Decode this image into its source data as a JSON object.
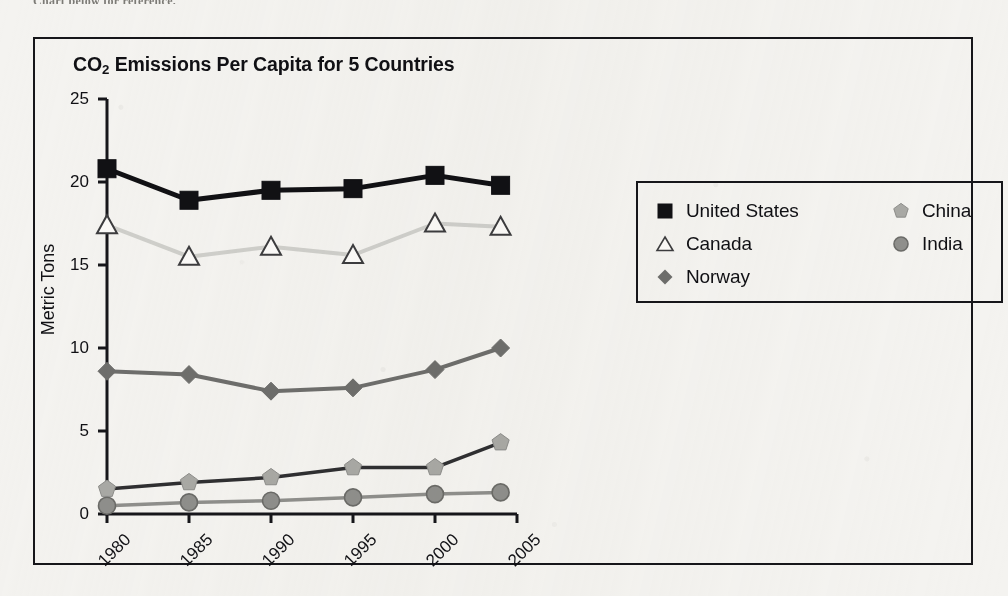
{
  "page": {
    "background_color": "#f4f3f0",
    "cut_text_top": "Chart below for reference."
  },
  "chart_frame": {
    "border_color": "#16161a"
  },
  "legend": {
    "position": "inside-right",
    "columns": [
      {
        "items": [
          {
            "label": "United States",
            "marker": "filled-square-marker",
            "color": "#111114"
          },
          {
            "label": "Canada",
            "marker": "open-triangle-marker",
            "color": "#cfcfcb"
          },
          {
            "label": "Norway",
            "marker": "filled-diamond-marker",
            "color": "#6e6e6c"
          }
        ]
      },
      {
        "items": [
          {
            "label": "China",
            "marker": "filled-pentagon-marker",
            "color": "#a9a9a5"
          },
          {
            "label": "India",
            "marker": "filled-circle-marker",
            "color": "#8f8f8c"
          }
        ]
      }
    ]
  },
  "chart_data": {
    "type": "line",
    "title": "CO2 Emissions Per Capita for 5 Countries",
    "title_html": "CO<sub>2</sub> Emissions Per Capita for 5 Countries",
    "xlabel": "",
    "ylabel": "Metric Tons",
    "x": [
      1980,
      1985,
      1990,
      1995,
      2000,
      2004
    ],
    "categories": [
      "1980",
      "1985",
      "1990",
      "1995",
      "2000",
      "2005"
    ],
    "xtick_labels": [
      "1980",
      "1985",
      "1990",
      "1995",
      "2000",
      "2005"
    ],
    "xtick_rotation": -45,
    "ytick_labels": [
      "0",
      "5",
      "10",
      "15",
      "20",
      "25"
    ],
    "yticks": [
      0,
      5,
      10,
      15,
      20,
      25
    ],
    "ylim": [
      0,
      25
    ],
    "xlim": [
      1978.6,
      2006.2
    ],
    "grid": false,
    "legend_position": "right",
    "series": [
      {
        "name": "United States",
        "values": [
          20.8,
          18.9,
          19.5,
          19.6,
          20.4,
          19.8
        ],
        "color": "#111114",
        "line_width": 5,
        "marker": "square"
      },
      {
        "name": "Canada",
        "values": [
          17.4,
          15.5,
          16.1,
          15.6,
          17.5,
          17.3
        ],
        "color": "#cfcfcb",
        "line_width": 4,
        "marker": "triangle-open"
      },
      {
        "name": "Norway",
        "values": [
          8.6,
          8.4,
          7.4,
          7.6,
          8.7,
          10.0
        ],
        "color": "#6e6e6c",
        "line_width": 4,
        "marker": "diamond"
      },
      {
        "name": "China",
        "values": [
          1.5,
          1.9,
          2.2,
          2.8,
          2.8,
          4.3
        ],
        "color": "#2f2f31",
        "marker_color": "#a9a9a5",
        "line_width": 3.5,
        "marker": "pentagon"
      },
      {
        "name": "India",
        "values": [
          0.5,
          0.7,
          0.8,
          1.0,
          1.2,
          1.3
        ],
        "color": "#8f8f8c",
        "marker_color": "#8f8f8c",
        "line_width": 3.5,
        "marker": "circle"
      }
    ]
  }
}
